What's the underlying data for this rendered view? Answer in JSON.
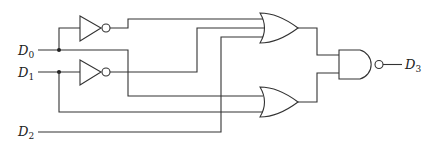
{
  "diagram": {
    "type": "logic-circuit",
    "colors": {
      "line": "#333333",
      "background": "#ffffff"
    },
    "inputs": [
      {
        "name": "D",
        "sub": "0"
      },
      {
        "name": "D",
        "sub": "1"
      },
      {
        "name": "D",
        "sub": "2"
      }
    ],
    "output": {
      "name": "D",
      "sub": "3"
    },
    "gates": [
      {
        "id": "not-1",
        "type": "NOT",
        "input": "D0"
      },
      {
        "id": "not-2",
        "type": "NOT",
        "input": "D1"
      },
      {
        "id": "or-1",
        "type": "OR",
        "inputs": [
          "NOT D0",
          "NOT D1",
          "D2"
        ]
      },
      {
        "id": "or-2",
        "type": "OR",
        "inputs": [
          "D0",
          "D1"
        ]
      },
      {
        "id": "nand-1",
        "type": "NAND",
        "inputs": [
          "or-1",
          "or-2"
        ],
        "output": "D3"
      }
    ]
  }
}
